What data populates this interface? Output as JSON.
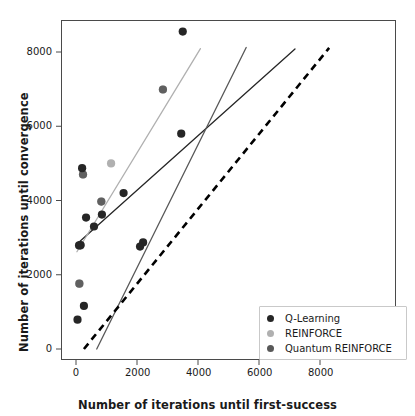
{
  "chart_data": {
    "type": "scatter",
    "title": "",
    "xlabel": "Number of iterations until first-success",
    "ylabel": "Number of iterations until convergence",
    "xlim": [
      -600,
      9200
    ],
    "ylim": [
      -700,
      9200
    ],
    "xticks": [
      0,
      2000,
      4000,
      6000,
      8000
    ],
    "yticks": [
      0,
      2000,
      4000,
      6000,
      8000
    ],
    "xtick_labels": [
      "0",
      "2000",
      "4000",
      "6000",
      "8000"
    ],
    "ytick_labels": [
      "0",
      "2000",
      "4000",
      "6000",
      "8000"
    ],
    "grid": false,
    "legend_position": "lower right",
    "series": [
      {
        "name": "Q-Learning",
        "color": "#262626",
        "points": [
          {
            "x": 3500,
            "y": 8550
          },
          {
            "x": 3450,
            "y": 5800
          },
          {
            "x": 1560,
            "y": 4200
          },
          {
            "x": 200,
            "y": 4870
          },
          {
            "x": 850,
            "y": 3620
          },
          {
            "x": 330,
            "y": 3540
          },
          {
            "x": 590,
            "y": 3300
          },
          {
            "x": 2200,
            "y": 2870
          },
          {
            "x": 2100,
            "y": 2760
          },
          {
            "x": 150,
            "y": 2800
          },
          {
            "x": 100,
            "y": 2790
          },
          {
            "x": 260,
            "y": 1160
          },
          {
            "x": 50,
            "y": 790
          }
        ],
        "fit_line": {
          "x0": 30,
          "y0": 2830,
          "x1": 7180,
          "y1": 8080
        }
      },
      {
        "name": "REINFORCE",
        "color": "#b0b0b0",
        "points": [
          {
            "x": 2850,
            "y": 6990
          },
          {
            "x": 1150,
            "y": 5000
          },
          {
            "x": 230,
            "y": 4700
          },
          {
            "x": 830,
            "y": 3970
          },
          {
            "x": 140,
            "y": 2790
          },
          {
            "x": 110,
            "y": 1760
          }
        ],
        "fit_line": {
          "x0": 30,
          "y0": 2620,
          "x1": 4080,
          "y1": 8090
        }
      },
      {
        "name": "Quantum REINFORCE",
        "color": "#585858",
        "points": [
          {
            "x": 2850,
            "y": 6990
          },
          {
            "x": 230,
            "y": 4700
          },
          {
            "x": 830,
            "y": 3970
          },
          {
            "x": 140,
            "y": 2790
          },
          {
            "x": 110,
            "y": 1760
          }
        ],
        "fit_line": {
          "x0": 680,
          "y0": 0,
          "x1": 5580,
          "y1": 8120
        }
      }
    ],
    "reference_line": {
      "name": "y = x diagonal",
      "style": "dashed",
      "color": "#000000",
      "x0": 260,
      "y0": 0,
      "x1": 8300,
      "y1": 8110
    }
  },
  "legend": {
    "items": [
      {
        "label": "Q-Learning",
        "color": "#262626"
      },
      {
        "label": "REINFORCE",
        "color": "#b0b0b0"
      },
      {
        "label": "Quantum REINFORCE",
        "color": "#585858"
      }
    ]
  }
}
